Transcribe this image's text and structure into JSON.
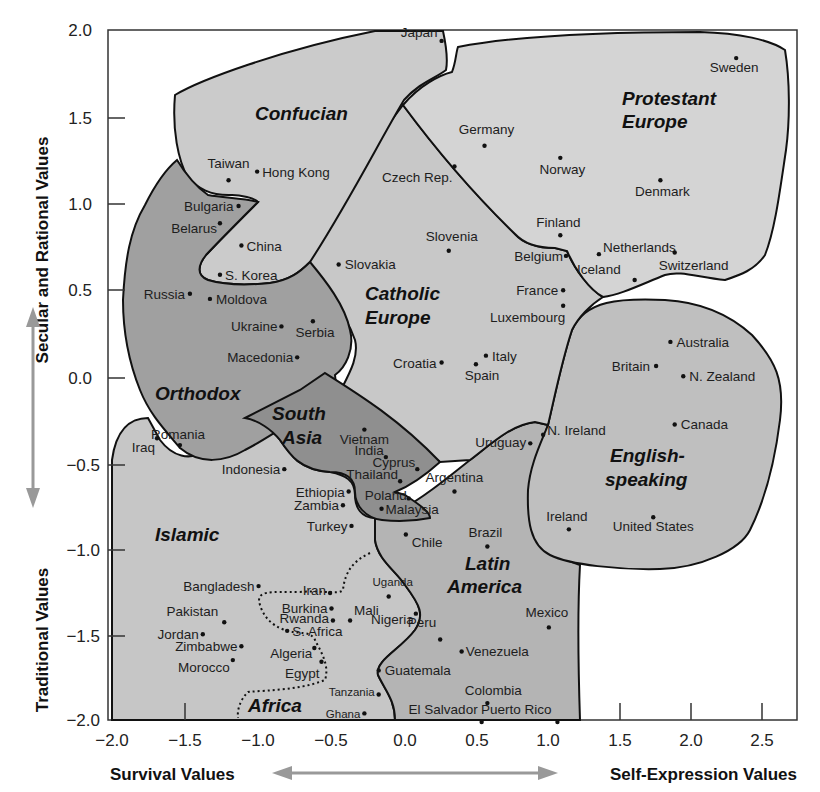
{
  "chart_data": {
    "type": "scatter",
    "title": "",
    "xlabel_left": "Survival Values",
    "xlabel_right": "Self-Expression Values",
    "ylabel_top": "Secular and Rational Values",
    "ylabel_bottom": "Traditional Values",
    "xlim": [
      -2.0,
      2.8
    ],
    "ylim": [
      -2.0,
      2.0
    ],
    "x_ticks": [
      "−2.0",
      "−1.5",
      "−1.0",
      "−0.5",
      "0.0",
      "0.5",
      "1.0",
      "1.5",
      "2.0",
      "2.5"
    ],
    "y_ticks": [
      "2.0",
      "1.5",
      "1.0",
      "0.5",
      "0.0",
      "−0.5",
      "−1.0",
      "−1.5",
      "−2.0"
    ],
    "grid": false,
    "legend": "none (cultural zones labeled inline)",
    "zones": [
      {
        "name": "Confucian",
        "label": "Confucian",
        "shade": "#c8c8c8"
      },
      {
        "name": "Protestant Europe",
        "label": "Protestant Europe",
        "shade": "#d2d2d2"
      },
      {
        "name": "Catholic Europe",
        "label": "Catholic Europe",
        "shade": "#c4c4c4"
      },
      {
        "name": "Orthodox",
        "label": "Orthodox",
        "shade": "#9e9e9e"
      },
      {
        "name": "South Asia",
        "label": "South Asia",
        "shade": "#8e8e8e"
      },
      {
        "name": "English-speaking",
        "label": "English-speaking",
        "shade": "#bdbdbd"
      },
      {
        "name": "Islamic",
        "label": "Islamic",
        "shade": "#c2c2c2"
      },
      {
        "name": "Latin America",
        "label": "Latin America",
        "shade": "#b0b0b0"
      },
      {
        "name": "Africa",
        "label": "Africa",
        "shade": "dotted outline"
      }
    ],
    "points": [
      {
        "country": "Japan",
        "x": 0.27,
        "y": 1.96,
        "zone": "Confucian"
      },
      {
        "country": "Sweden",
        "x": 2.33,
        "y": 1.86,
        "zone": "Protestant Europe"
      },
      {
        "country": "Germany",
        "x": 0.57,
        "y": 1.35,
        "zone": "Protestant Europe"
      },
      {
        "country": "Norway",
        "x": 1.1,
        "y": 1.28,
        "zone": "Protestant Europe"
      },
      {
        "country": "Denmark",
        "x": 1.8,
        "y": 1.15,
        "zone": "Protestant Europe"
      },
      {
        "country": "Finland",
        "x": 1.1,
        "y": 0.83,
        "zone": "Protestant Europe"
      },
      {
        "country": "Netherlands",
        "x": 1.37,
        "y": 0.72,
        "zone": "Protestant Europe"
      },
      {
        "country": "Switzerland",
        "x": 1.9,
        "y": 0.73,
        "zone": "Protestant Europe"
      },
      {
        "country": "Iceland",
        "x": 1.62,
        "y": 0.57,
        "zone": "Protestant Europe"
      },
      {
        "country": "Taiwan",
        "x": -1.22,
        "y": 1.15,
        "zone": "Confucian"
      },
      {
        "country": "Hong Kong",
        "x": -1.02,
        "y": 1.2,
        "zone": "Confucian"
      },
      {
        "country": "China",
        "x": -1.13,
        "y": 0.77,
        "zone": "Confucian"
      },
      {
        "country": "S. Korea",
        "x": -1.28,
        "y": 0.6,
        "zone": "Confucian"
      },
      {
        "country": "Czech Rep.",
        "x": 0.36,
        "y": 1.23,
        "zone": "Catholic Europe"
      },
      {
        "country": "Slovenia",
        "x": 0.32,
        "y": 0.74,
        "zone": "Catholic Europe"
      },
      {
        "country": "Slovakia",
        "x": -0.45,
        "y": 0.66,
        "zone": "Catholic Europe"
      },
      {
        "country": "Belgium",
        "x": 1.14,
        "y": 0.71,
        "zone": "Catholic Europe"
      },
      {
        "country": "France",
        "x": 1.12,
        "y": 0.51,
        "zone": "Catholic Europe"
      },
      {
        "country": "Luxembourg",
        "x": 1.12,
        "y": 0.42,
        "zone": "Catholic Europe"
      },
      {
        "country": "Italy",
        "x": 0.58,
        "y": 0.13,
        "zone": "Catholic Europe"
      },
      {
        "country": "Spain",
        "x": 0.51,
        "y": 0.08,
        "zone": "Catholic Europe"
      },
      {
        "country": "Croatia",
        "x": 0.27,
        "y": 0.09,
        "zone": "Catholic Europe"
      },
      {
        "country": "Bulgaria",
        "x": -1.15,
        "y": 1.0,
        "zone": "Orthodox"
      },
      {
        "country": "Belarus",
        "x": -1.28,
        "y": 0.9,
        "zone": "Orthodox"
      },
      {
        "country": "Russia",
        "x": -1.49,
        "y": 0.49,
        "zone": "Orthodox"
      },
      {
        "country": "Moldova",
        "x": -1.35,
        "y": 0.46,
        "zone": "Orthodox"
      },
      {
        "country": "Ukraine",
        "x": -0.85,
        "y": 0.3,
        "zone": "Orthodox"
      },
      {
        "country": "Serbia",
        "x": -0.63,
        "y": 0.33,
        "zone": "Orthodox"
      },
      {
        "country": "Macedonia",
        "x": -0.74,
        "y": 0.12,
        "zone": "Orthodox"
      },
      {
        "country": "Romania",
        "x": -1.56,
        "y": -0.39,
        "zone": "Orthodox"
      },
      {
        "country": "Vietnam",
        "x": -0.27,
        "y": -0.3,
        "zone": "South Asia"
      },
      {
        "country": "India",
        "x": -0.12,
        "y": -0.46,
        "zone": "South Asia"
      },
      {
        "country": "Cyprus",
        "x": 0.1,
        "y": -0.53,
        "zone": "South Asia"
      },
      {
        "country": "Thailand",
        "x": -0.02,
        "y": -0.6,
        "zone": "South Asia"
      },
      {
        "country": "Poland",
        "x": 0.04,
        "y": -0.7,
        "zone": "South Asia"
      },
      {
        "country": "Malaysia",
        "x": -0.15,
        "y": -0.76,
        "zone": "South Asia"
      },
      {
        "country": "Australia",
        "x": 1.87,
        "y": 0.21,
        "zone": "English-speaking"
      },
      {
        "country": "Britain",
        "x": 1.77,
        "y": 0.07,
        "zone": "English-speaking"
      },
      {
        "country": "N. Zealand",
        "x": 1.96,
        "y": 0.01,
        "zone": "English-speaking"
      },
      {
        "country": "Canada",
        "x": 1.9,
        "y": -0.27,
        "zone": "English-speaking"
      },
      {
        "country": "N. Ireland",
        "x": 0.98,
        "y": -0.33,
        "zone": "English-speaking"
      },
      {
        "country": "Ireland",
        "x": 1.16,
        "y": -0.88,
        "zone": "English-speaking"
      },
      {
        "country": "United States",
        "x": 1.75,
        "y": -0.81,
        "zone": "English-speaking"
      },
      {
        "country": "Uruguay",
        "x": 0.89,
        "y": -0.38,
        "zone": "Latin America"
      },
      {
        "country": "Argentina",
        "x": 0.36,
        "y": -0.66,
        "zone": "Latin America"
      },
      {
        "country": "Chile",
        "x": 0.02,
        "y": -0.91,
        "zone": "Latin America"
      },
      {
        "country": "Brazil",
        "x": 0.59,
        "y": -0.98,
        "zone": "Latin America"
      },
      {
        "country": "Mexico",
        "x": 1.02,
        "y": -1.45,
        "zone": "Latin America"
      },
      {
        "country": "Peru",
        "x": 0.26,
        "y": -1.52,
        "zone": "Latin America"
      },
      {
        "country": "Venezuela",
        "x": 0.41,
        "y": -1.59,
        "zone": "Latin America"
      },
      {
        "country": "Guatemala",
        "x": -0.17,
        "y": -1.7,
        "zone": "Latin America"
      },
      {
        "country": "Colombia",
        "x": 0.59,
        "y": -1.89,
        "zone": "Latin America"
      },
      {
        "country": "El Salvador",
        "x": 0.55,
        "y": -2.0,
        "zone": "Latin America"
      },
      {
        "country": "Puerto Rico",
        "x": 1.08,
        "y": -2.0,
        "zone": "Latin America"
      },
      {
        "country": "Iraq",
        "x": -1.72,
        "y": -0.35,
        "zone": "Islamic"
      },
      {
        "country": "Indonesia",
        "x": -0.83,
        "y": -0.53,
        "zone": "Islamic"
      },
      {
        "country": "Ethiopia",
        "x": -0.38,
        "y": -0.66,
        "zone": "Islamic"
      },
      {
        "country": "Zambia",
        "x": -0.42,
        "y": -0.74,
        "zone": "Islamic"
      },
      {
        "country": "Turkey",
        "x": -0.36,
        "y": -0.86,
        "zone": "Islamic"
      },
      {
        "country": "Bangladesh",
        "x": -1.01,
        "y": -1.21,
        "zone": "Islamic"
      },
      {
        "country": "Iran",
        "x": -0.51,
        "y": -1.25,
        "zone": "Islamic"
      },
      {
        "country": "Pakistan",
        "x": -1.25,
        "y": -1.42,
        "zone": "Islamic"
      },
      {
        "country": "Jordan",
        "x": -1.4,
        "y": -1.49,
        "zone": "Islamic"
      },
      {
        "country": "Zimbabwe",
        "x": -1.13,
        "y": -1.56,
        "zone": "Islamic/Africa"
      },
      {
        "country": "Morocco",
        "x": -1.19,
        "y": -1.64,
        "zone": "Islamic"
      },
      {
        "country": "Uganda",
        "x": -0.1,
        "y": -1.27,
        "zone": "Africa"
      },
      {
        "country": "Burkina",
        "x": -0.5,
        "y": -1.34,
        "zone": "Africa"
      },
      {
        "country": "Mali",
        "x": -0.37,
        "y": -1.41,
        "zone": "Africa"
      },
      {
        "country": "Rwanda",
        "x": -0.49,
        "y": -1.41,
        "zone": "Africa"
      },
      {
        "country": "Nigeria",
        "x": 0.09,
        "y": -1.37,
        "zone": "Africa"
      },
      {
        "country": "S. Africa",
        "x": -0.81,
        "y": -1.47,
        "zone": "Africa"
      },
      {
        "country": "Algeria",
        "x": -0.62,
        "y": -1.57,
        "zone": "Islamic"
      },
      {
        "country": "Egypt",
        "x": -0.57,
        "y": -1.65,
        "zone": "Islamic"
      },
      {
        "country": "Tanzania",
        "x": -0.17,
        "y": -1.84,
        "zone": "Africa"
      },
      {
        "country": "Ghana",
        "x": -0.27,
        "y": -1.95,
        "zone": "Africa"
      }
    ]
  }
}
